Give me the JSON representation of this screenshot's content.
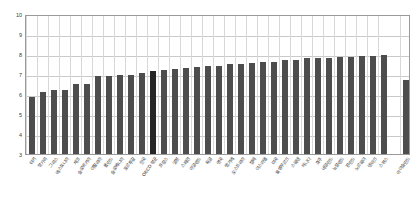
{
  "chart_data": {
    "type": "bar",
    "title": "",
    "subtitle": "",
    "xlabel": "",
    "ylabel": "",
    "ylim": [
      3,
      10
    ],
    "ytick_step": 1,
    "yticks": [
      "10",
      "9",
      "8",
      "7",
      "6",
      "5",
      "4",
      "3"
    ],
    "grid": true,
    "legend": "none",
    "bar_color": "#4d4d4d",
    "highlight_color": "#262626",
    "highlight_category": "OECD 평균",
    "gap_before_last": true,
    "categories": [
      "터키",
      "헝가리",
      "그리스",
      "에스토니아",
      "체코",
      "슬로바키아",
      "이탈리아",
      "폴란드",
      "슬로베니아",
      "포르투갈",
      "한국",
      "OECD 평균",
      "프랑스",
      "일본",
      "스페인",
      "아일랜드",
      "독일",
      "영국",
      "벨기에",
      "오스트리아",
      "칠레",
      "이스라엘",
      "미국",
      "룩셈부르크",
      "스웨덴",
      "캐나다",
      "호주",
      "네덜란드",
      "뉴질랜드",
      "핀란드",
      "노르웨이",
      "덴마크",
      "스위스",
      "아이슬란드"
    ],
    "values": [
      5.85,
      6.08,
      6.18,
      6.18,
      6.48,
      6.48,
      6.9,
      6.9,
      6.95,
      6.95,
      7.05,
      7.15,
      7.22,
      7.25,
      7.3,
      7.35,
      7.4,
      7.42,
      7.48,
      7.52,
      7.55,
      7.58,
      7.62,
      7.68,
      7.72,
      7.78,
      7.8,
      7.82,
      7.85,
      7.85,
      7.88,
      7.9,
      7.95,
      6.72
    ]
  }
}
